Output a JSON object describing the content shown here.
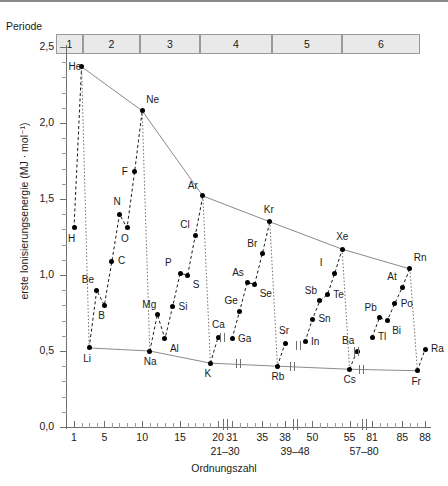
{
  "header": {
    "period_label": "Periode",
    "periods": [
      "1",
      "2",
      "3",
      "4",
      "5",
      "6"
    ]
  },
  "chart_data": {
    "type": "line",
    "title": "",
    "xlabel": "Ordnungszahl",
    "ylabel": "erste Ionisierungsenergie (MJ · mol⁻¹)",
    "ylim": [
      0.0,
      2.5
    ],
    "ytick_labels": [
      "0,0",
      "0,5",
      "1,0",
      "1,5",
      "2,0",
      "2,5"
    ],
    "ytick_values": [
      0.0,
      0.5,
      1.0,
      1.5,
      2.0,
      2.5
    ],
    "xtick_labels": [
      "1",
      "5",
      "10",
      "15",
      "20",
      "31",
      "35",
      "38",
      "50",
      "55",
      "81",
      "85",
      "88"
    ],
    "xtick_values": [
      1,
      5,
      10,
      15,
      20,
      31,
      35,
      38,
      50,
      55,
      81,
      85,
      88
    ],
    "axis_breaks": [
      "21–30",
      "39–48",
      "57–80"
    ],
    "grid": false,
    "legend": "none",
    "series": [
      {
        "name": "erste Ionisierungsenergie",
        "points": [
          {
            "z": 1,
            "symbol": "H",
            "value": 1.31,
            "label_pos": "below"
          },
          {
            "z": 2,
            "symbol": "He",
            "value": 2.37,
            "label_pos": "left"
          },
          {
            "z": 3,
            "symbol": "Li",
            "value": 0.52,
            "label_pos": "below"
          },
          {
            "z": 4,
            "symbol": "Be",
            "value": 0.9,
            "label_pos": "above-left"
          },
          {
            "z": 5,
            "symbol": "B",
            "value": 0.8,
            "label_pos": "below"
          },
          {
            "z": 6,
            "symbol": "C",
            "value": 1.09,
            "label_pos": "right"
          },
          {
            "z": 7,
            "symbol": "N",
            "value": 1.4,
            "label_pos": "above"
          },
          {
            "z": 8,
            "symbol": "O",
            "value": 1.31,
            "label_pos": "below"
          },
          {
            "z": 9,
            "symbol": "F",
            "value": 1.68,
            "label_pos": "left"
          },
          {
            "z": 10,
            "symbol": "Ne",
            "value": 2.08,
            "label_pos": "above-right"
          },
          {
            "z": 11,
            "symbol": "Na",
            "value": 0.5,
            "label_pos": "below"
          },
          {
            "z": 12,
            "symbol": "Mg",
            "value": 0.74,
            "label_pos": "above-left"
          },
          {
            "z": 13,
            "symbol": "Al",
            "value": 0.58,
            "label_pos": "below-right"
          },
          {
            "z": 14,
            "symbol": "Si",
            "value": 0.79,
            "label_pos": "right"
          },
          {
            "z": 15,
            "symbol": "P",
            "value": 1.01,
            "label_pos": "above-left"
          },
          {
            "z": 16,
            "symbol": "S",
            "value": 1.0,
            "label_pos": "below-right"
          },
          {
            "z": 17,
            "symbol": "Cl",
            "value": 1.26,
            "label_pos": "above-left"
          },
          {
            "z": 18,
            "symbol": "Ar",
            "value": 1.52,
            "label_pos": "above-left"
          },
          {
            "z": 19,
            "symbol": "K",
            "value": 0.42,
            "label_pos": "below"
          },
          {
            "z": 20,
            "symbol": "Ca",
            "value": 0.59,
            "label_pos": "above"
          },
          {
            "z": 31,
            "symbol": "Ga",
            "value": 0.58,
            "label_pos": "right"
          },
          {
            "z": 32,
            "symbol": "Ge",
            "value": 0.76,
            "label_pos": "above-left"
          },
          {
            "z": 33,
            "symbol": "As",
            "value": 0.95,
            "label_pos": "above-left"
          },
          {
            "z": 34,
            "symbol": "Se",
            "value": 0.94,
            "label_pos": "below-right"
          },
          {
            "z": 35,
            "symbol": "Br",
            "value": 1.14,
            "label_pos": "above-left"
          },
          {
            "z": 36,
            "symbol": "Kr",
            "value": 1.35,
            "label_pos": "above"
          },
          {
            "z": 37,
            "symbol": "Rb",
            "value": 0.4,
            "label_pos": "below"
          },
          {
            "z": 38,
            "symbol": "Sr",
            "value": 0.55,
            "label_pos": "above"
          },
          {
            "z": 49,
            "symbol": "In",
            "value": 0.56,
            "label_pos": "right"
          },
          {
            "z": 50,
            "symbol": "Sn",
            "value": 0.71,
            "label_pos": "right"
          },
          {
            "z": 51,
            "symbol": "Sb",
            "value": 0.83,
            "label_pos": "above-left"
          },
          {
            "z": 52,
            "symbol": "Te",
            "value": 0.87,
            "label_pos": "right"
          },
          {
            "z": 53,
            "symbol": "I",
            "value": 1.01,
            "label_pos": "above-left"
          },
          {
            "z": 54,
            "symbol": "Xe",
            "value": 1.17,
            "label_pos": "above"
          },
          {
            "z": 55,
            "symbol": "Cs",
            "value": 0.38,
            "label_pos": "below"
          },
          {
            "z": 56,
            "symbol": "Ba",
            "value": 0.5,
            "label_pos": "above-left"
          },
          {
            "z": 81,
            "symbol": "Tl",
            "value": 0.59,
            "label_pos": "right"
          },
          {
            "z": 82,
            "symbol": "Pb",
            "value": 0.72,
            "label_pos": "above-left"
          },
          {
            "z": 83,
            "symbol": "Bi",
            "value": 0.7,
            "label_pos": "below-right"
          },
          {
            "z": 84,
            "symbol": "Po",
            "value": 0.81,
            "label_pos": "right"
          },
          {
            "z": 85,
            "symbol": "At",
            "value": 0.92,
            "label_pos": "above-left"
          },
          {
            "z": 86,
            "symbol": "Rn",
            "value": 1.04,
            "label_pos": "above-right"
          },
          {
            "z": 87,
            "symbol": "Fr",
            "value": 0.37,
            "label_pos": "below"
          },
          {
            "z": 88,
            "symbol": "Ra",
            "value": 0.51,
            "label_pos": "right"
          }
        ],
        "noble_gas_envelope": [
          "He",
          "Ne",
          "Ar",
          "Kr",
          "Xe",
          "Rn"
        ],
        "alkali_baseline": [
          "Li",
          "Na",
          "K",
          "Rb",
          "Cs",
          "Fr"
        ]
      }
    ]
  }
}
